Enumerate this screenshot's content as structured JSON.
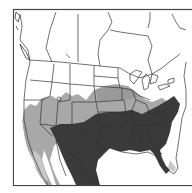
{
  "map": {
    "type": "range-map",
    "region": "North America (United States, southern Canada, northern Mexico)",
    "style": "grayscale choropleth",
    "colors": {
      "background": "#ffffff",
      "frame": "#444444",
      "border_lines": "#333333",
      "zone_none": "#ffffff",
      "zone_light": "#a8a8a8",
      "zone_dark": "#3a3a3a"
    },
    "zones": [
      {
        "id": "dark",
        "description": "Southeastern and south-central US, Texas, Mexico interior"
      },
      {
        "id": "light",
        "description": "Southwest US, central plains band, Mid-Atlantic, Baja/Mexico coasts"
      },
      {
        "id": "none",
        "description": "Canada, northern US"
      }
    ]
  }
}
